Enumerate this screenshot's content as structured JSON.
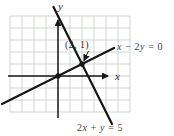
{
  "figure": {
    "x_axis_label": "x",
    "y_axis_label": "y",
    "point_label": "(2, 1)",
    "line1_label": "x − 2y = 0",
    "line2_label": "2x + y = 5"
  },
  "colors": {
    "ink": "#171717",
    "grid": "#d2d6d2",
    "text": "#3c3a38"
  },
  "chart_data": {
    "type": "line",
    "xlabel": "x",
    "ylabel": "y",
    "xlim": [
      -4,
      6
    ],
    "ylim": [
      -3,
      5
    ],
    "grid": true,
    "legend_position": "inline-annotations",
    "series": [
      {
        "name": "x − 2y = 0",
        "slope": 0.5,
        "intercept": 0,
        "x_range": [
          -4.67,
          4.67
        ]
      },
      {
        "name": "2x + y = 5",
        "slope": -2.0,
        "intercept": 5,
        "x_range": [
          -0.375,
          4.5
        ]
      }
    ],
    "marked_points": [
      {
        "x": 0,
        "y": 0,
        "label": ""
      },
      {
        "x": 2,
        "y": 1,
        "label": "(2, 1)"
      }
    ],
    "intersection": {
      "x": 2,
      "y": 1,
      "label": "(2, 1)"
    }
  }
}
